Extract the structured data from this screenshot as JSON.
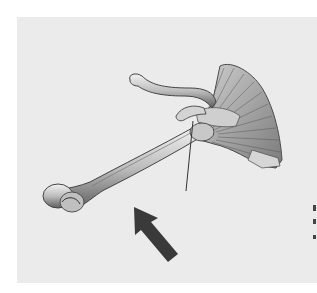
{
  "figure": {
    "background_color": "#ebebeb",
    "page_color": "#ffffff",
    "arrow_color": "#3a3a3a",
    "bone_light": "#d8d8d8",
    "bone_shadow": "#5a5a5a",
    "parts": [
      "humerus",
      "clavicle",
      "scapula",
      "arrow",
      "leader-line"
    ]
  }
}
